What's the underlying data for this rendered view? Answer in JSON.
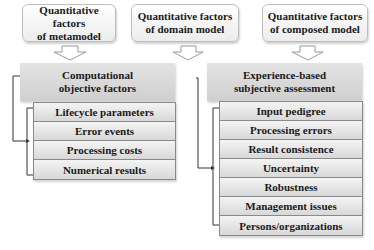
{
  "top_boxes": [
    {
      "line1": "Quantitative factors",
      "line2": "of metamodel"
    },
    {
      "line1": "Quantitative factors",
      "line2": "of domain model"
    },
    {
      "line1": "Quantitative factors",
      "line2": "of composed model"
    }
  ],
  "left": {
    "header_line1": "Computational",
    "header_line2": "objective factors",
    "items": [
      "Lifecycle parameters",
      "Error events",
      "Processing costs",
      "Numerical results"
    ]
  },
  "right": {
    "header_line1": "Experience-based",
    "header_line2": "subjective assessment",
    "items": [
      "Input pedigree",
      "Processing errors",
      "Result consistence",
      "Uncertainty",
      "Robustness",
      "Management issues",
      "Persons/organizations"
    ]
  }
}
